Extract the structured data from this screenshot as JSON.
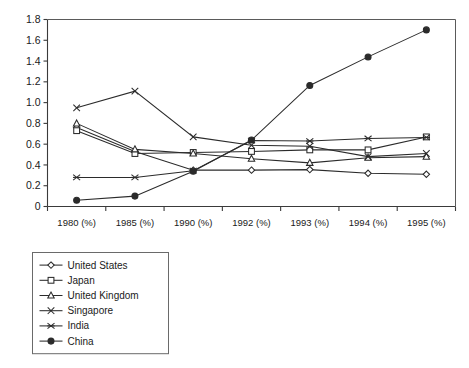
{
  "chart_data": {
    "type": "line",
    "title": "",
    "xlabel": "",
    "ylabel": "",
    "categories": [
      "1980 (%)",
      "1985 (%)",
      "1990 (%)",
      "1992 (%)",
      "1993 (%)",
      "1994 (%)",
      "1995 (%)"
    ],
    "ylim": [
      0,
      1.8
    ],
    "ytick_labels": [
      "0",
      "0.2",
      "0.4",
      "0.6",
      "0.8",
      "1.0",
      "1.2",
      "1.4",
      "1.6",
      "1.8"
    ],
    "ytick_values": [
      0,
      0.2,
      0.4,
      0.6,
      0.8,
      1.0,
      1.2,
      1.4,
      1.6,
      1.8
    ],
    "grid": false,
    "legend_position": "below-left",
    "series": [
      {
        "name": "United States",
        "marker": "diamond-open",
        "values": [
          0.76,
          0.53,
          0.35,
          0.35,
          0.355,
          0.32,
          0.31
        ]
      },
      {
        "name": "Japan",
        "marker": "square-open",
        "values": [
          0.73,
          0.51,
          0.52,
          0.53,
          0.545,
          0.545,
          0.67
        ]
      },
      {
        "name": "United Kingdom",
        "marker": "triangle-open",
        "values": [
          0.8,
          0.55,
          0.51,
          0.46,
          0.42,
          0.47,
          0.48
        ]
      },
      {
        "name": "Singapore",
        "marker": "cross-x",
        "values": [
          0.95,
          1.11,
          0.67,
          0.59,
          0.58,
          0.48,
          0.51
        ]
      },
      {
        "name": "India",
        "marker": "asterisk",
        "values": [
          0.28,
          0.28,
          0.345,
          0.635,
          0.63,
          0.655,
          0.665
        ]
      },
      {
        "name": "China",
        "marker": "circle-solid",
        "values": [
          0.06,
          0.1,
          0.34,
          0.64,
          1.165,
          1.44,
          1.7
        ]
      }
    ]
  }
}
